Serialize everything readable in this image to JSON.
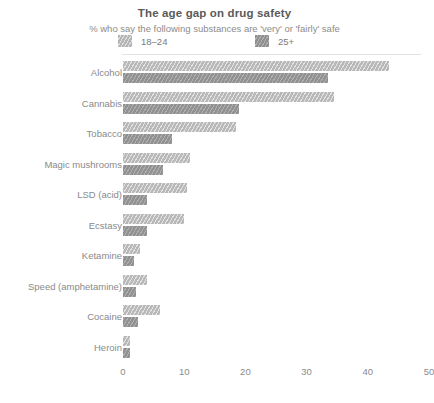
{
  "chart_data": {
    "type": "bar",
    "orientation": "horizontal",
    "title": "The age gap on drug safety",
    "subtitle": "% who say the following substances are 'very' or 'fairly' safe",
    "xlabel": "",
    "ylabel": "",
    "xlim": [
      0,
      50
    ],
    "xticks": [
      0,
      10,
      20,
      30,
      40,
      50
    ],
    "grid": false,
    "legend_position": "top",
    "categories": [
      "Alcohol",
      "Cannabis",
      "Tobacco",
      "Magic mushrooms",
      "LSD (acid)",
      "Ecstasy",
      "Ketamine",
      "Speed (amphetamine)",
      "Cocaine",
      "Heroin"
    ],
    "series": [
      {
        "name": "18–24",
        "color": "#b8b8b8",
        "values": [
          43.5,
          34.5,
          18.5,
          11,
          10.5,
          10,
          2.8,
          4,
          6,
          1.2
        ]
      },
      {
        "name": "25+",
        "color": "#919191",
        "values": [
          33.5,
          19,
          8,
          6.5,
          4,
          4,
          1.8,
          2.2,
          2.5,
          1.2
        ]
      }
    ]
  },
  "legend": {
    "items": [
      {
        "label": "18–24",
        "swatch": "young-swatch"
      },
      {
        "label": "25+",
        "swatch": "older-swatch"
      }
    ]
  },
  "axis": {
    "ticks": [
      "0",
      "10",
      "20",
      "30",
      "40",
      "50"
    ]
  }
}
